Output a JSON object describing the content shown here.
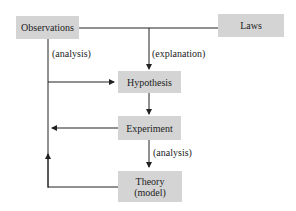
{
  "nodes": {
    "observations": "Observations",
    "laws": "Laws",
    "hypothesis": "Hypothesis",
    "experiment": "Experiment",
    "theory_line1": "Theory",
    "theory_line2": "(model)"
  },
  "edge_labels": {
    "analysis_top": "(analysis)",
    "explanation": "(explanation)",
    "analysis_bottom": "(analysis)"
  },
  "colors": {
    "box_fill": "#d4d4d4",
    "line": "#222222"
  }
}
